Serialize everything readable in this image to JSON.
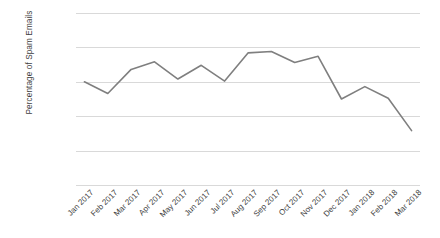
{
  "chart_data": {
    "type": "line",
    "title": "",
    "subtitle": "",
    "xlabel": "",
    "ylabel": "Percentage of Spam Emails",
    "categories": [
      "Jan 2017",
      "Feb 2017",
      "Mar 2017",
      "Apr 2017",
      "May 2017",
      "Jun 2017",
      "Jul 2017",
      "Aug 2017",
      "Sep 2017",
      "Oct 2017",
      "Nov 2017",
      "Dec 2017",
      "Jan 2018",
      "Feb 2018",
      "Mar 2018"
    ],
    "values": [
      55.0,
      53.3,
      56.8,
      57.9,
      55.4,
      57.4,
      55.1,
      59.2,
      59.4,
      57.8,
      58.7,
      52.5,
      54.3,
      52.6,
      47.9
    ],
    "value_unit": "%",
    "ylim": [
      40.0,
      65.0
    ],
    "ytick_step": 5.0,
    "ytick_labels": [
      "65.00%",
      "60.00%",
      "55.00%",
      "50.00%",
      "45.00%",
      "40.00%"
    ],
    "ytick_values": [
      65.0,
      60.0,
      55.0,
      50.0,
      45.0,
      40.0
    ],
    "grid": true,
    "legend": false,
    "legend_position": "none",
    "series_color": "#7f7f7f",
    "gridline_color": "#d9d9d9",
    "background_color": "#ffffff",
    "text_color": "#3f3f3f"
  }
}
